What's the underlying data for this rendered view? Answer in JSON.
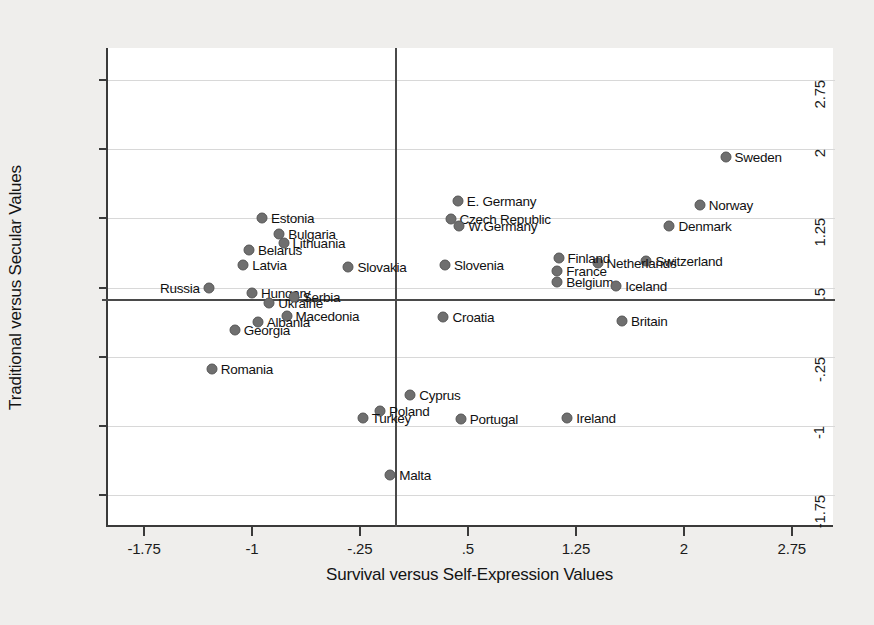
{
  "chart_data": {
    "type": "scatter",
    "title": "",
    "xlabel": "Survival versus Self-Expression Values",
    "ylabel": "Traditional versus Secular Values",
    "xlim": [
      -2.0,
      3.05
    ],
    "ylim": [
      -2.1,
      3.1
    ],
    "xticks": [
      "-1.75",
      "-1",
      "-.25",
      ".5",
      "1.25",
      "2",
      "2.75"
    ],
    "xtick_values": [
      -1.75,
      -1,
      -0.25,
      0.5,
      1.25,
      2,
      2.75
    ],
    "yticks": [
      "2.75",
      "2",
      "1.25",
      ".5",
      "-.25",
      "-1",
      "-1.75"
    ],
    "ytick_values": [
      2.75,
      2,
      1.25,
      0.5,
      -0.25,
      -1,
      -1.75
    ],
    "grid": true,
    "legend": "none",
    "reference_lines": {
      "vertical_x": 0.0,
      "horizontal_y": 0.36
    },
    "points": [
      {
        "label": "Sweden",
        "x": 2.29,
        "y": 1.92,
        "label_side": "right"
      },
      {
        "label": "Norway",
        "x": 2.11,
        "y": 1.4,
        "label_side": "right"
      },
      {
        "label": "Denmark",
        "x": 1.9,
        "y": 1.17,
        "label_side": "right"
      },
      {
        "label": "E. Germany",
        "x": 0.43,
        "y": 1.44,
        "label_side": "right"
      },
      {
        "label": "Czech Republic",
        "x": 0.38,
        "y": 1.24,
        "label_side": "right"
      },
      {
        "label": "W.Germany",
        "x": 0.44,
        "y": 1.17,
        "label_side": "right"
      },
      {
        "label": "Switzerland",
        "x": 1.74,
        "y": 0.79,
        "label_side": "right"
      },
      {
        "label": "Netherlands",
        "x": 1.4,
        "y": 0.77,
        "label_side": "right"
      },
      {
        "label": "Finland",
        "x": 1.13,
        "y": 0.82,
        "label_side": "right"
      },
      {
        "label": "France",
        "x": 1.12,
        "y": 0.68,
        "label_side": "right"
      },
      {
        "label": "Belgium",
        "x": 1.12,
        "y": 0.56,
        "label_side": "right"
      },
      {
        "label": "Iceland",
        "x": 1.53,
        "y": 0.52,
        "label_side": "right"
      },
      {
        "label": "Slovenia",
        "x": 0.34,
        "y": 0.74,
        "label_side": "right"
      },
      {
        "label": "Slovakia",
        "x": -0.33,
        "y": 0.72,
        "label_side": "right"
      },
      {
        "label": "Estonia",
        "x": -0.93,
        "y": 1.26,
        "label_side": "right"
      },
      {
        "label": "Bulgaria",
        "x": -0.81,
        "y": 1.08,
        "label_side": "right"
      },
      {
        "label": "Lithuania",
        "x": -0.78,
        "y": 0.98,
        "label_side": "right"
      },
      {
        "label": "Belarus",
        "x": -1.02,
        "y": 0.91,
        "label_side": "right"
      },
      {
        "label": "Latvia",
        "x": -1.06,
        "y": 0.74,
        "label_side": "right"
      },
      {
        "label": "Russia",
        "x": -1.3,
        "y": 0.5,
        "label_side": "left"
      },
      {
        "label": "Hungary",
        "x": -1.0,
        "y": 0.44,
        "label_side": "right"
      },
      {
        "label": "Ukraine",
        "x": -0.88,
        "y": 0.33,
        "label_side": "right"
      },
      {
        "label": "Serbia",
        "x": -0.71,
        "y": 0.4,
        "label_side": "right"
      },
      {
        "label": "Macedonia",
        "x": -0.76,
        "y": 0.19,
        "label_side": "right"
      },
      {
        "label": "Albania",
        "x": -0.96,
        "y": 0.13,
        "label_side": "right"
      },
      {
        "label": "Georgia",
        "x": -1.12,
        "y": 0.04,
        "label_side": "right"
      },
      {
        "label": "Croatia",
        "x": 0.33,
        "y": 0.18,
        "label_side": "right"
      },
      {
        "label": "Britain",
        "x": 1.57,
        "y": 0.14,
        "label_side": "right"
      },
      {
        "label": "Romania",
        "x": -1.28,
        "y": -0.38,
        "label_side": "right"
      },
      {
        "label": "Cyprus",
        "x": 0.1,
        "y": -0.67,
        "label_side": "right"
      },
      {
        "label": "Poland",
        "x": -0.11,
        "y": -0.84,
        "label_side": "right"
      },
      {
        "label": "Turkey",
        "x": -0.23,
        "y": -0.92,
        "label_side": "right"
      },
      {
        "label": "Portugal",
        "x": 0.45,
        "y": -0.93,
        "label_side": "right"
      },
      {
        "label": "Ireland",
        "x": 1.19,
        "y": -0.92,
        "label_side": "right"
      },
      {
        "label": "Malta",
        "x": -0.04,
        "y": -1.53,
        "label_side": "right"
      }
    ]
  }
}
